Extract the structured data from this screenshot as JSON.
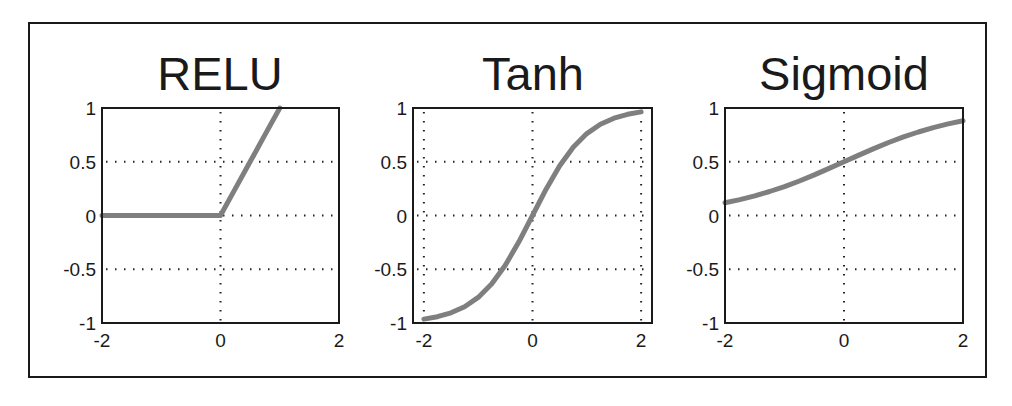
{
  "figure": {
    "background": "#ffffff",
    "curve_color": "#7f7f7f",
    "axis_color": "#1a1a1a"
  },
  "chart_data": [
    {
      "type": "line",
      "title": "RELU",
      "xlabel": "",
      "ylabel": "",
      "xlim": [
        -2,
        2
      ],
      "ylim": [
        -1,
        1
      ],
      "xticks": [
        -2,
        0,
        2
      ],
      "xtick_labels": [
        "-2",
        "0",
        "2"
      ],
      "yticks": [
        -1,
        -0.5,
        0,
        0.5,
        1
      ],
      "ytick_labels": [
        "-1",
        "-0.5",
        "0",
        "0.5",
        "1"
      ],
      "grid": true,
      "grid_x": [
        0
      ],
      "grid_y": [
        -0.5,
        0,
        0.5
      ],
      "series": [
        {
          "name": "RELU",
          "x": [
            -2,
            -1.5,
            -1,
            -0.5,
            0,
            0.25,
            0.5,
            0.75,
            1
          ],
          "y": [
            0,
            0,
            0,
            0,
            0,
            0.25,
            0.5,
            0.75,
            1
          ]
        }
      ]
    },
    {
      "type": "line",
      "title": "Tanh",
      "xlabel": "",
      "ylabel": "",
      "xlim": [
        -2.2,
        2.2
      ],
      "ylim": [
        -1,
        1
      ],
      "xticks": [
        -2,
        0,
        2
      ],
      "xtick_labels": [
        "-2",
        "0",
        "2"
      ],
      "yticks": [
        -1,
        -0.5,
        0,
        0.5,
        1
      ],
      "ytick_labels": [
        "-1",
        "-0.5",
        "0",
        "0.5",
        "1"
      ],
      "grid": true,
      "grid_x": [
        -2,
        0,
        2
      ],
      "grid_y": [
        -0.5,
        0,
        0.5
      ],
      "series": [
        {
          "name": "Tanh",
          "x": [
            -2,
            -1.75,
            -1.5,
            -1.25,
            -1,
            -0.75,
            -0.5,
            -0.25,
            0,
            0.25,
            0.5,
            0.75,
            1,
            1.25,
            1.5,
            1.75,
            2
          ],
          "y": [
            -0.964,
            -0.941,
            -0.905,
            -0.848,
            -0.762,
            -0.635,
            -0.462,
            -0.245,
            0,
            0.245,
            0.462,
            0.635,
            0.762,
            0.848,
            0.905,
            0.941,
            0.964
          ]
        }
      ]
    },
    {
      "type": "line",
      "title": "Sigmoid",
      "xlabel": "",
      "ylabel": "",
      "xlim": [
        -2,
        2
      ],
      "ylim": [
        -1,
        1
      ],
      "xticks": [
        -2,
        0,
        2
      ],
      "xtick_labels": [
        "-2",
        "0",
        "2"
      ],
      "yticks": [
        -1,
        -0.5,
        0,
        0.5,
        1
      ],
      "ytick_labels": [
        "-1",
        "-0.5",
        "0",
        "0.5",
        "1"
      ],
      "grid": true,
      "grid_x": [
        0
      ],
      "grid_y": [
        -0.5,
        0,
        0.5
      ],
      "series": [
        {
          "name": "Sigmoid",
          "x": [
            -2,
            -1.75,
            -1.5,
            -1.25,
            -1,
            -0.75,
            -0.5,
            -0.25,
            0,
            0.25,
            0.5,
            0.75,
            1,
            1.25,
            1.5,
            1.75,
            2
          ],
          "y": [
            0.119,
            0.148,
            0.182,
            0.223,
            0.269,
            0.321,
            0.378,
            0.438,
            0.5,
            0.562,
            0.622,
            0.679,
            0.731,
            0.777,
            0.818,
            0.852,
            0.881
          ]
        }
      ]
    }
  ]
}
